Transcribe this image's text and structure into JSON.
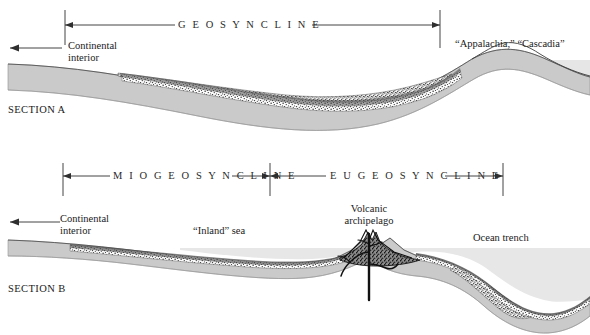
{
  "figure": {
    "background_color": "#ffffff",
    "ink_color": "#1a1a1a",
    "crust_color": "#c9c9c9",
    "water_color": "#e4e4e4",
    "sediment_color": "#f2f2f2",
    "stipple_color": "#3a3a3a"
  },
  "section_a": {
    "name": "SECTION A",
    "span_label": "G E O S Y N C L I N E",
    "span_label_plain": "GEOSYNCLINE",
    "continental_interior": "Continental\ninterior",
    "continental_interior_line1": "Continental",
    "continental_interior_line2": "interior",
    "highland_label": "“Appalachia,” “Cascadia”",
    "span_left_px": 65,
    "span_right_px": 440
  },
  "section_b": {
    "name": "SECTION B",
    "span_label_mio": "M I O G E O S Y N C L I N E",
    "span_label_mio_plain": "MIOGEOSYNCLINE",
    "span_label_eu": "E U G E O S Y N C L I N E",
    "span_label_eu_plain": "EUGEOSYNCLINE",
    "continental_interior_line1": "Continental",
    "continental_interior_line2": "interior",
    "inland_sea_label": "“Inland” sea",
    "volcanic_line1": "Volcanic",
    "volcanic_line2": "archipelago",
    "ocean_trench_label": "Ocean trench",
    "mio_left_px": 63,
    "mio_right_px": 270,
    "eu_left_px": 270,
    "eu_right_px": 503
  }
}
